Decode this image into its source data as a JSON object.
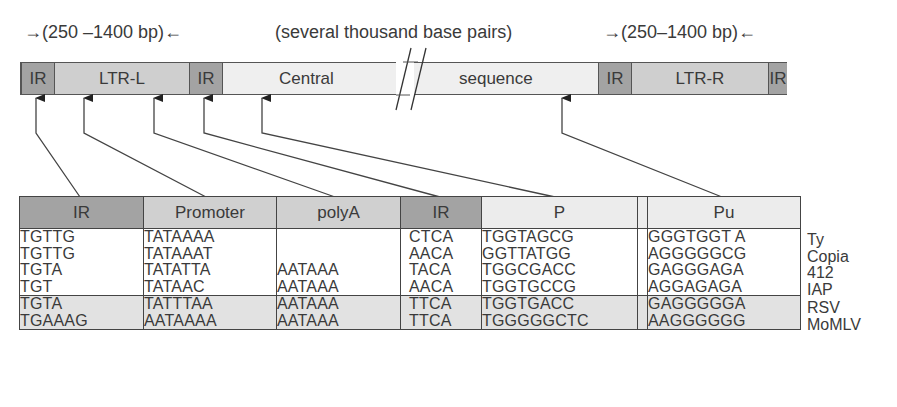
{
  "top_labels": {
    "left_span": "(250 –1400 bp)",
    "middle_span": "(several thousand base pairs)",
    "right_span": "(250–1400 bp)"
  },
  "element_bar": {
    "segments": [
      {
        "label": "IR",
        "type": "inverted-repeat"
      },
      {
        "label": "LTR-L",
        "type": "long-terminal-repeat"
      },
      {
        "label": "IR",
        "type": "inverted-repeat"
      },
      {
        "label": "Central",
        "type": "central"
      },
      {
        "label": "sequence",
        "type": "central"
      },
      {
        "label": "IR",
        "type": "inverted-repeat"
      },
      {
        "label": "LTR-R",
        "type": "long-terminal-repeat"
      },
      {
        "label": "IR",
        "type": "inverted-repeat"
      }
    ]
  },
  "table": {
    "headers": [
      "IR",
      "Promoter",
      "polyA",
      "IR",
      "P",
      "Pu"
    ],
    "groups": [
      {
        "rows": [
          {
            "ir1": "TGTTG",
            "promoter": "TATAAAA",
            "polya": "",
            "ir2": "CTCA",
            "p": "TGGTAGCG",
            "pu": "GGGTGGT A",
            "organism": "Ty"
          },
          {
            "ir1": "TGTTG",
            "promoter": "TATAAAT",
            "polya": "",
            "ir2": "AACA",
            "p": "GGTTATGG",
            "pu": "AGGGGGCG",
            "organism": "Copia"
          },
          {
            "ir1": "TGTA",
            "promoter": "TATATTA",
            "polya": "AATAAA",
            "ir2": "TACA",
            "p": "TGGCGACC",
            "pu": "GAGGGAGA",
            "organism": "412"
          },
          {
            "ir1": "TGT",
            "promoter": "TATAAC",
            "polya": "AATAAA",
            "ir2": "AACA",
            "p": "TGGTGCCG",
            "pu": "AGGAGAGA",
            "organism": "IAP"
          }
        ]
      },
      {
        "rows": [
          {
            "ir1": "TGTA",
            "promoter": "TATTTAA",
            "polya": "AATAAA",
            "ir2": "TTCA",
            "p": "TGGTGACC",
            "pu": "GAGGGGGA",
            "organism": "RSV"
          },
          {
            "ir1": "TGAAAG",
            "promoter": "AATAAAA",
            "polya": "AATAAA",
            "ir2": "TTCA",
            "p": "TGGGGGCTC",
            "pu": "AAGGGGGG",
            "organism": "MoMLV"
          }
        ]
      }
    ]
  },
  "colors": {
    "ir": "#a3a3a3",
    "ltr": "#cfcfcf",
    "central": "#efefef",
    "group2_bg": "#e2e2e2",
    "line": "#444444"
  }
}
